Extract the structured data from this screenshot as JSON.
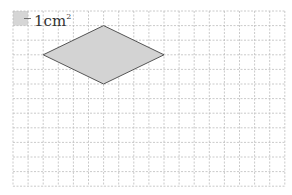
{
  "legend": {
    "unit_label": "1cm",
    "unit_exponent": "2",
    "swatch_color": "#d6d6d6"
  },
  "grid": {
    "columns": 18,
    "rows": 12,
    "origin_x": 13,
    "origin_y": 11,
    "cell_w": 15.1,
    "cell_h": 14.6,
    "line_color": "#bdbdbd"
  },
  "shape": {
    "type": "rhombus",
    "fill": "#d3d3d3",
    "stroke": "#555555",
    "vertices_grid": [
      [
        2,
        3
      ],
      [
        6,
        1
      ],
      [
        10,
        3
      ],
      [
        6,
        5
      ]
    ],
    "horizontal_diagonal_cells": 8,
    "vertical_diagonal_cells": 4
  }
}
